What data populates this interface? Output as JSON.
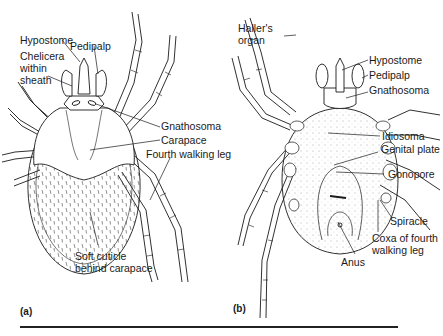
{
  "figure": {
    "panels": [
      {
        "id": "a",
        "tag": "(a)",
        "labels": {
          "hypostome": "Hypostome",
          "pedipalp": "Pedipalp",
          "chelicera": "Chelicera\nwithin\nsheath",
          "gnathosoma": "Gnathosoma",
          "carapace": "Carapace",
          "fourth_leg": "Fourth walking leg",
          "soft_cuticle": "Soft cuticle\nbehind carapace"
        }
      },
      {
        "id": "b",
        "tag": "(b)",
        "labels": {
          "hallers_organ": "Haller's\norgan",
          "hypostome": "Hypostome",
          "pedipalp": "Pedipalp",
          "gnathosoma": "Gnathosoma",
          "idiosoma": "Idiosoma",
          "genital_plate": "Genital plate",
          "gonopore": "Gonopore",
          "spiracle": "Spiracle",
          "coxa": "Coxa of fourth\nwalking leg",
          "anus": "Anus"
        }
      }
    ],
    "colors": {
      "ink": "#1a1a1a",
      "background": "#ffffff"
    }
  }
}
